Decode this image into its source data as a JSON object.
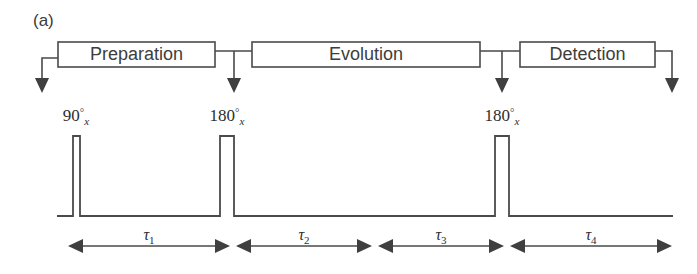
{
  "figure": {
    "panel_label": "(a)",
    "type": "nmr-pulse-sequence-diagram"
  },
  "blocks": [
    {
      "label": "Preparation",
      "x": 58,
      "y": 42,
      "width": 157,
      "height": 25
    },
    {
      "label": "Evolution",
      "x": 252,
      "y": 42,
      "width": 228,
      "height": 25
    },
    {
      "label": "Detection",
      "x": 520,
      "y": 42,
      "width": 135,
      "height": 25
    }
  ],
  "event_arrows": [
    {
      "name": "arrow-to-90x",
      "x": 42,
      "kind": "elbow-left"
    },
    {
      "name": "arrow-to-180x-first",
      "x": 234,
      "kind": "tee"
    },
    {
      "name": "arrow-to-180x-second",
      "x": 502,
      "kind": "tee"
    },
    {
      "name": "arrow-end",
      "x": 672,
      "kind": "elbow-right"
    }
  ],
  "pulses": [
    {
      "name": "pulse-90x",
      "angle": "90",
      "degree_symbol": "°",
      "axis": "x",
      "x": 73,
      "width": 7,
      "height": 80
    },
    {
      "name": "pulse-180x-first",
      "angle": "180",
      "degree_symbol": "°",
      "axis": "x",
      "x": 220,
      "width": 14,
      "height": 80
    },
    {
      "name": "pulse-180x-second",
      "angle": "180",
      "degree_symbol": "°",
      "axis": "x",
      "x": 495,
      "width": 14,
      "height": 80
    }
  ],
  "intervals": [
    {
      "symbol": "τ",
      "subscript": "1",
      "label": "τ1",
      "from": 72,
      "to": 226
    },
    {
      "symbol": "τ",
      "subscript": "2",
      "label": "τ2",
      "from": 240,
      "to": 368
    },
    {
      "symbol": "τ",
      "subscript": "3",
      "label": "τ3",
      "from": 382,
      "to": 500
    },
    {
      "symbol": "τ",
      "subscript": "4",
      "label": "τ4",
      "from": 514,
      "to": 668
    }
  ],
  "baseline": {
    "y": 216,
    "from": 57,
    "to": 673
  },
  "interval_axis_y": 246,
  "colors": {
    "stroke": "#4a4a4a",
    "text": "#3a3a3a",
    "arrow_fill": "#3f3f3f",
    "background": "#ffffff"
  }
}
